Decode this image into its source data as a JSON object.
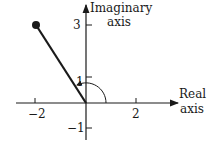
{
  "diagram": {
    "axes": {
      "real_label_line1": "Real",
      "real_label_line2": "axis",
      "imag_label_line1": "Imaginary",
      "imag_label_line2": "axis"
    },
    "ticks": {
      "x_neg2": "−2",
      "x_2": "2",
      "y_3": "3",
      "y_1": "1",
      "y_neg1": "−1"
    },
    "point": {
      "re": -2,
      "im": 3
    },
    "angle_arc": "counterclockwise from positive real axis to vector",
    "colors": {
      "ink": "#1a1a1a",
      "background": "#ffffff"
    }
  }
}
